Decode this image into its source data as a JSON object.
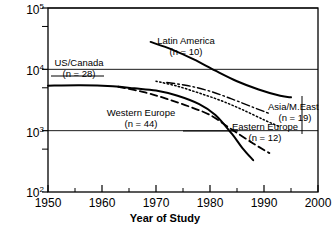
{
  "chart_data": {
    "type": "line",
    "title": "",
    "xlabel": "Year of Study",
    "ylabel": "Mean total DDT (ug/kg in milk fat)",
    "xlim": [
      1950,
      2000
    ],
    "ylim": [
      100,
      100000
    ],
    "yscale": "log",
    "grid": false,
    "legend_position": "inline-annotations",
    "xticks": [
      "1950",
      "1960",
      "1970",
      "1980",
      "1990",
      "2000"
    ],
    "xtick_values": [
      1950,
      1960,
      1970,
      1980,
      1990,
      2000
    ],
    "xminor_ticks": [
      1955,
      1965,
      1975,
      1985,
      1995
    ],
    "yticks": [
      "10",
      "10",
      "10",
      "10"
    ],
    "ytick_exponents": [
      "5",
      "4",
      "3",
      "2"
    ],
    "ytick_values": [
      100000,
      10000,
      1000,
      100
    ],
    "yminor_ticks": [
      50000,
      5000,
      500
    ],
    "series": [
      {
        "name": "US/Canada",
        "n": 28,
        "label": "US/Canada",
        "sublabel": "(n = 28)",
        "style": "solid",
        "points": [
          {
            "x": 1950,
            "y": 5400
          },
          {
            "x": 1956,
            "y": 5500
          },
          {
            "x": 1962,
            "y": 5300
          },
          {
            "x": 1966,
            "y": 4900
          },
          {
            "x": 1970,
            "y": 4500
          },
          {
            "x": 1974,
            "y": 3700
          },
          {
            "x": 1978,
            "y": 2700
          },
          {
            "x": 1981,
            "y": 1800
          },
          {
            "x": 1984,
            "y": 900
          },
          {
            "x": 1986,
            "y": 520
          },
          {
            "x": 1988,
            "y": 330
          }
        ]
      },
      {
        "name": "Western Europe",
        "n": 44,
        "label": "Western Europe",
        "sublabel": "(n = 44)",
        "style": "dashed",
        "points": [
          {
            "x": 1963,
            "y": 5200
          },
          {
            "x": 1968,
            "y": 4200
          },
          {
            "x": 1972,
            "y": 3300
          },
          {
            "x": 1976,
            "y": 2500
          },
          {
            "x": 1980,
            "y": 1800
          },
          {
            "x": 1984,
            "y": 1050
          },
          {
            "x": 1988,
            "y": 620
          },
          {
            "x": 1991,
            "y": 430
          }
        ]
      },
      {
        "name": "Eastern Europe",
        "n": 12,
        "label": "Eastern Europe",
        "sublabel": "(n = 12)",
        "style": "dotted",
        "points": [
          {
            "x": 1970,
            "y": 6400
          },
          {
            "x": 1974,
            "y": 5300
          },
          {
            "x": 1978,
            "y": 4100
          },
          {
            "x": 1982,
            "y": 3100
          },
          {
            "x": 1986,
            "y": 2200
          },
          {
            "x": 1990,
            "y": 1500
          },
          {
            "x": 1993,
            "y": 1150
          }
        ]
      },
      {
        "name": "Asia/M.East",
        "n": 19,
        "label": "Asia/M.East",
        "sublabel": "(n = 19)",
        "style": "dashdot",
        "points": [
          {
            "x": 1972,
            "y": 6100
          },
          {
            "x": 1976,
            "y": 5400
          },
          {
            "x": 1980,
            "y": 4400
          },
          {
            "x": 1984,
            "y": 3300
          },
          {
            "x": 1988,
            "y": 2400
          },
          {
            "x": 1991,
            "y": 1900
          }
        ]
      },
      {
        "name": "Latin America",
        "n": 10,
        "label": "Latin America",
        "sublabel": "(n = 10)",
        "style": "solid",
        "points": [
          {
            "x": 1969,
            "y": 28000
          },
          {
            "x": 1973,
            "y": 21000
          },
          {
            "x": 1977,
            "y": 14500
          },
          {
            "x": 1981,
            "y": 9500
          },
          {
            "x": 1985,
            "y": 6400
          },
          {
            "x": 1989,
            "y": 4700
          },
          {
            "x": 1993,
            "y": 3700
          },
          {
            "x": 1995,
            "y": 3500
          }
        ]
      }
    ],
    "annotations": [
      {
        "name": "us-canada",
        "text": "US/Canada",
        "sub": "(n = 28)"
      },
      {
        "name": "latin-america",
        "text": "Latin America",
        "sub": "(n = 10)"
      },
      {
        "name": "western-europe",
        "text": "Western Europe",
        "sub": "(n = 44)"
      },
      {
        "name": "asia-meast",
        "text": "Asia/M.East",
        "sub": "(n = 19)"
      },
      {
        "name": "eastern-europe",
        "text": "Eastern Europe",
        "sub": "(n = 12)"
      }
    ],
    "colors": {
      "line": "#000000",
      "axis": "#000000",
      "background": "#ffffff"
    }
  }
}
